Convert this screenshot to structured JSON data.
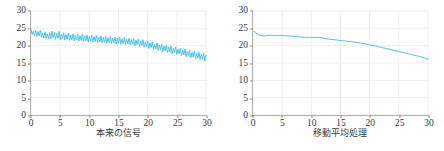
{
  "figure": {
    "background": "#ffffff",
    "line_color": "#4fc3e8",
    "axis_color": "#8a8a8a",
    "grid_color": "#ebebeb",
    "tick_text_color": "#3b3b3b"
  },
  "panels": [
    {
      "caption": "本来の信号",
      "xticks": [
        "0",
        "5",
        "10",
        "15",
        "20",
        "25",
        "30"
      ],
      "yticks": [
        "0",
        "5",
        "10",
        "15",
        "20",
        "25",
        "30"
      ]
    },
    {
      "caption": "移動平均処理",
      "xticks": [
        "0",
        "5",
        "10",
        "15",
        "20",
        "25",
        "30"
      ],
      "yticks": [
        "0",
        "5",
        "10",
        "15",
        "20",
        "25",
        "30"
      ]
    }
  ],
  "chart_data": [
    {
      "type": "line",
      "title": "",
      "subtitle": "",
      "xlabel": "本来の信号",
      "ylabel": "",
      "xlim": [
        0,
        30
      ],
      "ylim": [
        0,
        30
      ],
      "xticks": [
        0,
        5,
        10,
        15,
        20,
        25,
        30
      ],
      "yticks": [
        0,
        5,
        10,
        15,
        20,
        25,
        30
      ],
      "grid": true,
      "legend": "none",
      "annotations": [],
      "series": [
        {
          "name": "本来の信号",
          "color": "#4fc3e8",
          "x": [
            0,
            0.2,
            0.4,
            0.6,
            0.8,
            1,
            1.2,
            1.4,
            1.6,
            1.8,
            2,
            2.2,
            2.4,
            2.6,
            2.8,
            3,
            3.2,
            3.4,
            3.6,
            3.8,
            4,
            4.2,
            4.4,
            4.6,
            4.8,
            5,
            5.2,
            5.4,
            5.6,
            5.8,
            6,
            6.2,
            6.4,
            6.6,
            6.8,
            7,
            7.2,
            7.4,
            7.6,
            7.8,
            8,
            8.2,
            8.4,
            8.6,
            8.8,
            9,
            9.2,
            9.4,
            9.6,
            9.8,
            10,
            10.2,
            10.4,
            10.6,
            10.8,
            11,
            11.2,
            11.4,
            11.6,
            11.8,
            12,
            12.2,
            12.4,
            12.6,
            12.8,
            13,
            13.2,
            13.4,
            13.6,
            13.8,
            14,
            14.2,
            14.4,
            14.6,
            14.8,
            15,
            15.2,
            15.4,
            15.6,
            15.8,
            16,
            16.2,
            16.4,
            16.6,
            16.8,
            17,
            17.2,
            17.4,
            17.6,
            17.8,
            18,
            18.2,
            18.4,
            18.6,
            18.8,
            19,
            19.2,
            19.4,
            19.6,
            19.8,
            20,
            20.2,
            20.4,
            20.6,
            20.8,
            21,
            21.2,
            21.4,
            21.6,
            21.8,
            22,
            22.2,
            22.4,
            22.6,
            22.8,
            23,
            23.2,
            23.4,
            23.6,
            23.8,
            24,
            24.2,
            24.4,
            24.6,
            24.8,
            25,
            25.2,
            25.4,
            25.6,
            25.8,
            26,
            26.2,
            26.4,
            26.6,
            26.8,
            27,
            27.2,
            27.4,
            27.6,
            27.8,
            28,
            28.2,
            28.4,
            28.6,
            28.8,
            29,
            29.2,
            29.4,
            29.6,
            29.8,
            30
          ],
          "y": [
            24.6,
            23.3,
            24.2,
            22.9,
            24.4,
            22.6,
            24.1,
            22.8,
            24.5,
            22.4,
            23.6,
            22.2,
            24.0,
            22.1,
            23.4,
            21.9,
            23.8,
            22.0,
            24.2,
            22.3,
            23.9,
            21.8,
            23.5,
            22.1,
            24.1,
            21.7,
            23.3,
            21.9,
            23.7,
            21.6,
            23.2,
            21.8,
            23.6,
            21.5,
            23.1,
            21.7,
            23.4,
            21.4,
            23.0,
            21.6,
            23.3,
            21.3,
            22.9,
            21.5,
            23.2,
            21.2,
            22.8,
            21.4,
            23.1,
            21.1,
            22.7,
            21.3,
            23.0,
            21.0,
            22.6,
            21.2,
            22.9,
            20.9,
            22.5,
            21.1,
            22.8,
            20.8,
            22.4,
            21.0,
            22.7,
            20.7,
            22.3,
            20.9,
            22.6,
            20.6,
            22.2,
            20.8,
            22.5,
            20.5,
            22.1,
            20.7,
            22.4,
            20.4,
            22.0,
            20.6,
            22.3,
            20.3,
            21.9,
            20.5,
            22.2,
            20.2,
            21.8,
            20.4,
            22.1,
            20.0,
            21.6,
            20.2,
            21.9,
            19.8,
            21.4,
            20.0,
            21.7,
            19.5,
            21.1,
            19.7,
            21.4,
            19.2,
            20.8,
            19.4,
            21.1,
            18.9,
            20.5,
            19.1,
            20.8,
            18.6,
            20.2,
            18.8,
            20.5,
            18.3,
            19.9,
            18.5,
            20.2,
            18.0,
            19.6,
            18.2,
            19.9,
            17.7,
            19.3,
            17.9,
            19.6,
            17.4,
            19.0,
            17.6,
            19.3,
            17.1,
            18.7,
            17.3,
            19.0,
            16.8,
            18.4,
            17.0,
            18.7,
            16.5,
            18.1,
            16.7,
            18.4,
            16.2,
            17.8,
            16.4,
            18.1,
            15.9,
            17.5,
            16.1,
            17.8,
            15.6,
            17.2,
            15.2,
            16.4,
            14.9,
            15.1
          ]
        }
      ]
    },
    {
      "type": "line",
      "title": "",
      "subtitle": "",
      "xlabel": "移動平均処理",
      "ylabel": "",
      "xlim": [
        0,
        30
      ],
      "ylim": [
        0,
        30
      ],
      "xticks": [
        0,
        5,
        10,
        15,
        20,
        25,
        30
      ],
      "yticks": [
        0,
        5,
        10,
        15,
        20,
        25,
        30
      ],
      "grid": true,
      "legend": "none",
      "annotations": [],
      "series": [
        {
          "name": "移動平均処理",
          "color": "#4fc3e8",
          "x": [
            0,
            0.5,
            1,
            1.5,
            2,
            2.5,
            3,
            3.5,
            4,
            4.5,
            5,
            5.5,
            6,
            6.5,
            7,
            7.5,
            8,
            8.5,
            9,
            9.5,
            10,
            10.5,
            11,
            11.5,
            12,
            12.5,
            13,
            13.5,
            14,
            14.5,
            15,
            15.5,
            16,
            16.5,
            17,
            17.5,
            18,
            18.5,
            19,
            19.5,
            20,
            20.5,
            21,
            21.5,
            22,
            22.5,
            23,
            23.5,
            24,
            24.5,
            25,
            25.5,
            26,
            26.5,
            27,
            27.5,
            28,
            28.5,
            29,
            29.5,
            30
          ],
          "y": [
            24.3,
            23.6,
            23.1,
            22.9,
            22.8,
            22.9,
            23.0,
            23.0,
            22.9,
            22.9,
            23.0,
            22.9,
            22.8,
            22.8,
            22.7,
            22.6,
            22.5,
            22.5,
            22.4,
            22.4,
            22.4,
            22.3,
            22.4,
            22.3,
            22.2,
            22.0,
            21.9,
            21.8,
            21.7,
            21.6,
            21.5,
            21.4,
            21.3,
            21.2,
            21.1,
            21.0,
            20.9,
            20.7,
            20.6,
            20.4,
            20.2,
            20.0,
            19.9,
            19.7,
            19.5,
            19.3,
            19.1,
            18.9,
            18.7,
            18.5,
            18.3,
            18.1,
            17.9,
            17.7,
            17.5,
            17.3,
            17.1,
            16.9,
            16.7,
            16.4,
            16.1
          ]
        }
      ]
    }
  ]
}
